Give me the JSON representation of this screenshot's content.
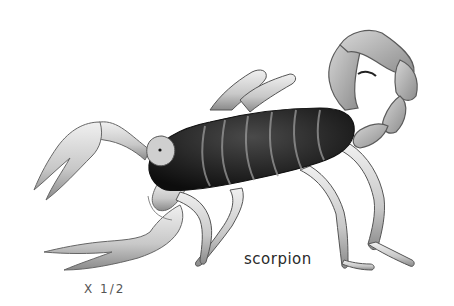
{
  "illustration": {
    "subject": "scorpion",
    "style": "grayscale pencil illustration",
    "colors": {
      "body_dark": "#1a1a1a",
      "limb_mid": "#b5b5b5",
      "limb_light": "#e4e4e4",
      "outline": "#6a6a6a",
      "background": "#ffffff"
    }
  },
  "caption": {
    "label": "scorpion"
  },
  "scale_note": {
    "label": "X 1/2"
  }
}
